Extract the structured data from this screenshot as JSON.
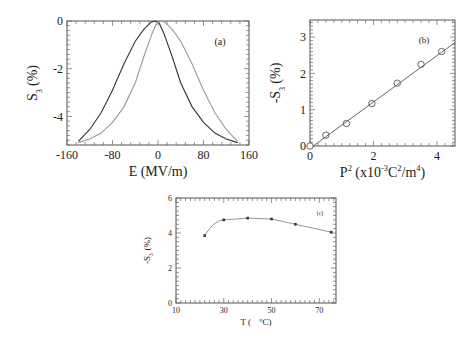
{
  "chart_data": [
    {
      "id": "a",
      "type": "line",
      "panel_label": "(a)",
      "title": "",
      "xlabel": "E (MV/m)",
      "ylabel": "S3 (%)",
      "ylabel_main": "S",
      "ylabel_sub": "3",
      "ylabel_unit": "(%)",
      "xlim": [
        -160,
        160
      ],
      "ylim": [
        -5.2,
        0
      ],
      "xticks": [
        -160,
        -80,
        0,
        80,
        160
      ],
      "xtick_labels": [
        "-160",
        "-80",
        "0",
        "80",
        "160"
      ],
      "yticks": [
        0,
        -2,
        -4
      ],
      "ytick_labels": [
        "0",
        "-2",
        "-4"
      ],
      "grid": false,
      "series": [
        {
          "name": "increasing field sweep",
          "color": "#333333",
          "x": [
            -140,
            -120,
            -100,
            -80,
            -60,
            -40,
            -25,
            -12,
            -5,
            2,
            10,
            25,
            40,
            60,
            80,
            100,
            120,
            140
          ],
          "y": [
            -5.05,
            -4.55,
            -3.85,
            -2.9,
            -1.8,
            -0.85,
            -0.35,
            -0.05,
            0.0,
            -0.08,
            -0.5,
            -1.5,
            -2.6,
            -3.6,
            -4.25,
            -4.7,
            -4.95,
            -5.1
          ]
        },
        {
          "name": "decreasing field sweep",
          "color": "#999999",
          "x": [
            -140,
            -120,
            -100,
            -80,
            -60,
            -40,
            -25,
            -10,
            -2,
            5,
            12,
            25,
            40,
            60,
            80,
            100,
            120,
            140
          ],
          "y": [
            -5.1,
            -4.95,
            -4.7,
            -4.25,
            -3.6,
            -2.6,
            -1.5,
            -0.5,
            -0.08,
            0.0,
            -0.05,
            -0.35,
            -0.85,
            -1.8,
            -2.9,
            -3.85,
            -4.55,
            -5.05
          ]
        }
      ]
    },
    {
      "id": "b",
      "type": "scatter",
      "panel_label": "(b)",
      "title": "",
      "xlabel": "P 2 (x10 -3 C2/m4)",
      "xlabel_parts": [
        "P",
        "2",
        " (x10",
        "-3",
        "C",
        "2",
        "/m",
        "4",
        ")"
      ],
      "ylabel": "-S3 (%)",
      "ylabel_main": "-S",
      "ylabel_sub": "3",
      "ylabel_unit": "(%)",
      "xlim": [
        0,
        4.57
      ],
      "ylim": [
        0,
        3.47
      ],
      "xticks": [
        0,
        2,
        4
      ],
      "xtick_labels": [
        "0",
        "2",
        "4"
      ],
      "yticks": [
        0,
        1,
        2,
        3
      ],
      "ytick_labels": [
        "0",
        "1",
        "2",
        "3"
      ],
      "grid": false,
      "series": [
        {
          "name": "data",
          "marker": "open-circle",
          "x": [
            0.0,
            0.5,
            1.15,
            1.95,
            2.75,
            3.5,
            4.15
          ],
          "y": [
            0.0,
            0.3,
            0.62,
            1.17,
            1.73,
            2.25,
            2.6
          ]
        },
        {
          "name": "linear fit",
          "type": "line",
          "x": [
            0.1,
            4.57
          ],
          "y": [
            0.0,
            2.85
          ]
        }
      ]
    },
    {
      "id": "c",
      "type": "line",
      "panel_label": "(c)",
      "title": "",
      "xlabel": "T ( °C)",
      "xlabel_main": "T (",
      "xlabel_unit": "°C)",
      "ylabel": "-S3 (%)",
      "ylabel_main": "-S",
      "ylabel_sub": "3",
      "ylabel_unit": "(%)",
      "xlim": [
        10,
        77
      ],
      "ylim": [
        0,
        6
      ],
      "xticks": [
        10,
        30,
        50,
        70
      ],
      "xtick_labels": [
        "10",
        "30",
        "50",
        "70"
      ],
      "yticks": [
        0,
        2,
        4,
        6
      ],
      "ytick_labels": [
        "0",
        "2",
        "4",
        "6"
      ],
      "grid": false,
      "series": [
        {
          "name": "data",
          "marker": "filled-square",
          "x": [
            22,
            30,
            40,
            50,
            60,
            75
          ],
          "y": [
            3.85,
            4.75,
            4.85,
            4.8,
            4.5,
            4.05
          ]
        }
      ]
    }
  ]
}
